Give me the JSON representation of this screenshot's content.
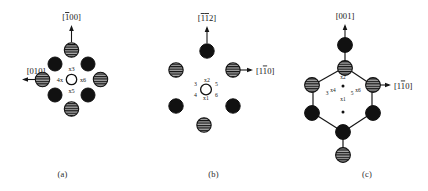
{
  "figure": {
    "background_color": "#ffffff",
    "ink_color": "#161616"
  },
  "atom_styles": {
    "hatched": {
      "name": "hatched-atom",
      "fill": "#9a9a9a",
      "stripe": "#111111",
      "stroke": "#111111"
    },
    "solid": {
      "name": "solid-atom",
      "fill": "#111111",
      "stroke": "#111111"
    },
    "open": {
      "name": "open-atom",
      "fill": "#ffffff",
      "stroke": "#111111"
    }
  },
  "panels": [
    {
      "id": "a",
      "caption": "(a)",
      "directions": [
        {
          "name": "direction-up",
          "label": "[100]",
          "overbar_digits": [
            0
          ],
          "arrow": "up"
        },
        {
          "name": "direction-left",
          "label": "[010]",
          "overbar_digits": [],
          "arrow": "left"
        }
      ],
      "site_labels": [
        {
          "name": "site-3",
          "text": "x3",
          "position": "top"
        },
        {
          "name": "site-4",
          "text": "4x",
          "position": "left"
        },
        {
          "name": "site-6",
          "text": "x6",
          "position": "right"
        },
        {
          "name": "site-5",
          "text": "x5",
          "position": "bottom"
        }
      ],
      "atoms": [
        {
          "style": "hatched",
          "position": "top"
        },
        {
          "style": "hatched",
          "position": "left"
        },
        {
          "style": "hatched",
          "position": "right"
        },
        {
          "style": "hatched",
          "position": "bottom"
        },
        {
          "style": "solid",
          "position": "upper-left"
        },
        {
          "style": "solid",
          "position": "upper-right"
        },
        {
          "style": "solid",
          "position": "lower-left"
        },
        {
          "style": "solid",
          "position": "lower-right"
        },
        {
          "style": "open",
          "position": "center"
        }
      ]
    },
    {
      "id": "b",
      "caption": "(b)",
      "directions": [
        {
          "name": "direction-up",
          "label": "[112]",
          "overbar_digits": [
            0,
            1
          ],
          "arrow": "up"
        },
        {
          "name": "direction-right",
          "label": "[110]",
          "overbar_digits": [
            1
          ],
          "arrow": "right"
        }
      ],
      "site_labels": [
        {
          "name": "site-3",
          "text": "3",
          "position": "upper-left"
        },
        {
          "name": "site-2",
          "text": "x2",
          "position": "top"
        },
        {
          "name": "site-5",
          "text": "5",
          "position": "upper-right"
        },
        {
          "name": "site-4",
          "text": "4",
          "position": "lower-left"
        },
        {
          "name": "site-1",
          "text": "x1",
          "position": "bottom"
        },
        {
          "name": "site-6",
          "text": "6",
          "position": "lower-right"
        }
      ],
      "atoms": [
        {
          "style": "solid",
          "position": "top"
        },
        {
          "style": "hatched",
          "position": "upper-left"
        },
        {
          "style": "hatched",
          "position": "upper-right"
        },
        {
          "style": "solid",
          "position": "lower-left"
        },
        {
          "style": "solid",
          "position": "lower-right"
        },
        {
          "style": "hatched",
          "position": "bottom"
        },
        {
          "style": "open",
          "position": "center"
        }
      ]
    },
    {
      "id": "c",
      "caption": "(c)",
      "directions": [
        {
          "name": "direction-up",
          "label": "[001]",
          "overbar_digits": [],
          "arrow": "up"
        },
        {
          "name": "direction-right",
          "label": "[110]",
          "overbar_digits": [
            1
          ],
          "arrow": "right"
        }
      ],
      "site_labels": [
        {
          "name": "site-2",
          "text": "x2",
          "position": "top"
        },
        {
          "name": "site-3",
          "text": "3",
          "position": "left-outer"
        },
        {
          "name": "site-4",
          "text": "4",
          "position": "left-inner"
        },
        {
          "name": "site-5",
          "text": "5",
          "position": "right-inner"
        },
        {
          "name": "site-6",
          "text": "6",
          "position": "right-outer"
        },
        {
          "name": "site-1",
          "text": "x1",
          "position": "bottom"
        }
      ],
      "atoms": [
        {
          "style": "solid",
          "position": "top-outer"
        },
        {
          "style": "hatched",
          "position": "hex-top"
        },
        {
          "style": "hatched",
          "position": "hex-upper-left"
        },
        {
          "style": "hatched",
          "position": "hex-upper-right"
        },
        {
          "style": "solid",
          "position": "hex-lower-left"
        },
        {
          "style": "solid",
          "position": "hex-lower-right"
        },
        {
          "style": "solid",
          "position": "hex-bottom"
        },
        {
          "style": "hatched",
          "position": "bottom-outer"
        }
      ],
      "bonds": [
        "top-outer to hex-top",
        "hex-top to hex-upper-left",
        "hex-top to hex-upper-right",
        "hex-upper-left to hex-lower-left",
        "hex-upper-right to hex-lower-right",
        "hex-lower-left to hex-bottom",
        "hex-lower-right to hex-bottom",
        "hex-bottom to bottom-outer"
      ]
    }
  ]
}
